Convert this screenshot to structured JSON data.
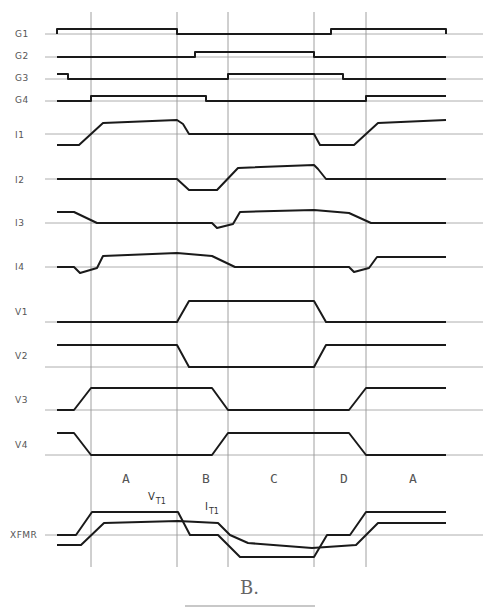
{
  "diagram": {
    "type": "timing-diagram",
    "x_range": [
      57,
      446
    ],
    "baseline_extent": [
      45,
      483
    ],
    "phase_boundaries_x": [
      91,
      177,
      228,
      314,
      366
    ],
    "regions": [
      {
        "label": "A",
        "x": 126
      },
      {
        "label": "B",
        "x": 206
      },
      {
        "label": "C",
        "x": 274
      },
      {
        "label": "D",
        "x": 344
      },
      {
        "label": "A",
        "x": 413
      }
    ],
    "signals": [
      {
        "name": "G1",
        "label_y": 34,
        "baseline": 34,
        "points": "57,34 57,29 177,29 177,34 331,34 331,29 446,29 446,34"
      },
      {
        "name": "G2",
        "label_y": 56,
        "baseline": 57,
        "points": "57,57 195,57 195,52 314,52 314,57 446,57"
      },
      {
        "name": "G3",
        "label_y": 78,
        "baseline": 79,
        "points": "57,74 68,74 68,79 228,79 228,74 343,74 343,79 446,79"
      },
      {
        "name": "G4",
        "label_y": 100,
        "baseline": 101,
        "points": "57,101 91,101 91,96 206,96 206,101 366,101 366,96 446,96"
      },
      {
        "name": "I1",
        "label_y": 135,
        "baseline": 134,
        "points": "57,145 79,145 103,123 177,120 183,124 189,134 314,134 320,145 354,145 378,123 446,120"
      },
      {
        "name": "I2",
        "label_y": 180,
        "baseline": 179,
        "points": "57,179 177,179 189,190 217,190 238,168 314,165 318,169 326,179 446,179"
      },
      {
        "name": "I3",
        "label_y": 223,
        "baseline": 223,
        "points": "57,212 74,212 97,223 212,223 217,228 233,224 240,212 314,210 349,213 371,223 446,223"
      },
      {
        "name": "I4",
        "label_y": 267,
        "baseline": 267,
        "points": "57,267 74,267 80,273 97,268 103,256 177,253 212,256 235,267 349,267 354,272 369,268 377,257 446,257"
      },
      {
        "name": "V1",
        "label_y": 312,
        "baseline": 322,
        "points": "57,322 177,322 189,301 314,301 326,322 446,322"
      },
      {
        "name": "V2",
        "label_y": 356,
        "baseline": 367,
        "points": "57,345 177,345 189,367 314,367 326,345 446,345"
      },
      {
        "name": "V3",
        "label_y": 400,
        "baseline": 410,
        "points": "57,410 74,410 91,388 212,388 228,410 349,410 366,388 446,388"
      },
      {
        "name": "V4",
        "label_y": 445,
        "baseline": 455,
        "points": "57,433 74,433 91,455 212,455 228,433 349,433 366,455 446,455"
      }
    ],
    "xfmr": {
      "label": "XFMR",
      "label_y": 538,
      "baseline": 535,
      "voltage_trace": "57,535 76,535 92,512 178,512 190,535 218,535 240,557 314,557 327,535 350,535 366,512 446,512",
      "current_trace": "57,545 81,545 104,523 178,521 218,523 230,535 248,543 312,548 356,545 378,523 446,523",
      "annotations": [
        {
          "text": "V",
          "sub": "T1",
          "x": 148,
          "y": 500
        },
        {
          "text": "I",
          "sub": "T1",
          "x": 205,
          "y": 510
        }
      ],
      "grid_bottom": 567
    },
    "panel_label": "B."
  }
}
